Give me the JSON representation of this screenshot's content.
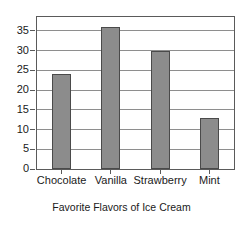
{
  "chart_data": {
    "type": "bar",
    "title": "",
    "subtitle": "",
    "xlabel": "Favorite Flavors of Ice Cream",
    "ylabel": "",
    "categories": [
      "Chocolate",
      "Vanilla",
      "Strawberry",
      "Mint"
    ],
    "values": [
      24,
      36,
      30,
      13
    ],
    "ylim": [
      0,
      38.5
    ],
    "yticks": [
      0,
      5,
      10,
      15,
      20,
      25,
      30,
      35
    ],
    "ytick_labels": [
      "0",
      "5",
      "10",
      "15",
      "20",
      "25",
      "30",
      "35"
    ],
    "grid": true,
    "grid_axis": "y",
    "legend": false,
    "legend_position": "none",
    "orientation": "vertical",
    "bar_color": "#8c8c8c",
    "bar_edge_color": "#4a4a4a",
    "plot_background": "#ffffff",
    "plot_border_color": "#5a5a5a",
    "gridline_color": "#8e8e8e",
    "text_color": "#1a1a1a",
    "annotations": []
  }
}
